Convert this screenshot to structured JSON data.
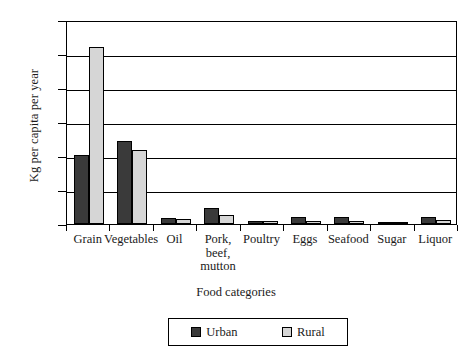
{
  "chart_data": {
    "type": "bar",
    "title": "",
    "xlabel": "Food categories",
    "ylabel": "Kg per capita per year",
    "ylim": [
      0,
      300
    ],
    "yticks": [
      0,
      50,
      100,
      150,
      200,
      250,
      300
    ],
    "ytick_labels": [
      "0",
      "50",
      "100",
      "150",
      "200",
      "250",
      "300"
    ],
    "grid": true,
    "legend_position": "bottom-center",
    "categories": [
      "Grain",
      "Vegetables",
      "Oil",
      "Pork,\nbeef,\nmutton",
      "Poultry",
      "Eggs",
      "Seafood",
      "Sugar",
      "Liquor"
    ],
    "series": [
      {
        "name": "Urban",
        "color": "#3a3a3a",
        "values": [
          101,
          122,
          9,
          23,
          5,
          10,
          10,
          3,
          10
        ]
      },
      {
        "name": "Rural",
        "color": "#d6d6d6",
        "values": [
          261,
          109,
          7,
          13,
          4,
          5,
          5,
          2,
          6
        ]
      }
    ]
  },
  "legend": {
    "items": [
      {
        "label": "Urban",
        "swatch": "urban"
      },
      {
        "label": "Rural",
        "swatch": "rural"
      }
    ]
  }
}
